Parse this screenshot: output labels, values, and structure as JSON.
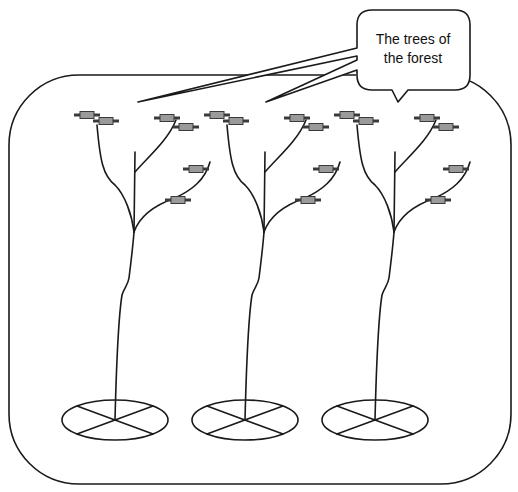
{
  "diagram": {
    "callout": {
      "line1": "The trees of",
      "line2": "the forest"
    },
    "colors": {
      "line": "#1a1a1a",
      "leaf_fill": "#9a9a9a",
      "leaf_wire": "#3a3a3a",
      "background": "#ffffff"
    },
    "trees": [
      {
        "label": "tree-1"
      },
      {
        "label": "tree-2"
      },
      {
        "label": "tree-3"
      }
    ]
  }
}
